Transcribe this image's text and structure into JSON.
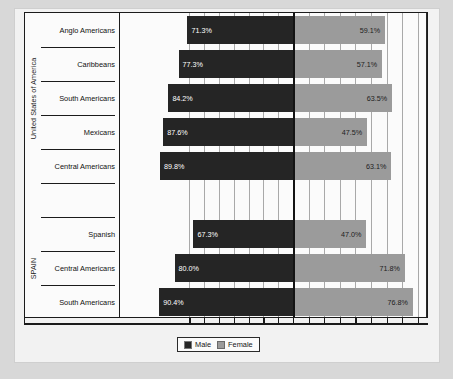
{
  "legend": {
    "items": [
      {
        "label": "Male",
        "color": "#252525",
        "icon": "legend-swatch-male"
      },
      {
        "label": "Female",
        "color": "#9b9b9b",
        "icon": "legend-swatch-female"
      }
    ]
  },
  "groups": [
    {
      "caption": "United States of America"
    },
    {
      "caption": "SPAIN"
    }
  ],
  "chart_data": {
    "type": "bar",
    "subtype": "back-to-back-horizontal-bar",
    "title": "",
    "xlabel": "",
    "ylabel": "",
    "grid": true,
    "legend_position": "bottom-center",
    "value_suffix": "%",
    "axis_tick_labels": [],
    "xlim": [
      0,
      100
    ],
    "groups": [
      {
        "name": "United States of America",
        "categories": [
          "Anglo Americans",
          "Caribbeans",
          "South Americans",
          "Mexicans",
          "Central Americans"
        ],
        "series": [
          {
            "name": "Male",
            "values": [
              71.3,
              77.3,
              84.2,
              87.6,
              89.8
            ],
            "labels": [
              "71.3%",
              "77.3%",
              "84.2%",
              "87.6%",
              "89.8%"
            ]
          },
          {
            "name": "Female",
            "values": [
              59.1,
              57.1,
              63.5,
              47.5,
              63.1
            ],
            "labels": [
              "59.1%",
              "57.1%",
              "63.5%",
              "47.5%",
              "63.1%"
            ]
          }
        ]
      },
      {
        "name": "SPAIN",
        "categories": [
          "Spanish",
          "Central Americans",
          "South Americans"
        ],
        "series": [
          {
            "name": "Male",
            "values": [
              67.3,
              80.0,
              90.4
            ],
            "labels": [
              "67.3%",
              "80.0%",
              "90.4%"
            ]
          },
          {
            "name": "Female",
            "values": [
              47.0,
              71.8,
              76.8
            ],
            "labels": [
              "47.0%",
              "71.8%",
              "76.8%"
            ]
          }
        ]
      }
    ],
    "rows": [
      {
        "group": "United States of America",
        "category": "Anglo Americans",
        "male": 71.3,
        "male_label": "71.3%",
        "female": 59.1,
        "female_label": "59.1%"
      },
      {
        "group": "United States of America",
        "category": "Caribbeans",
        "male": 77.3,
        "male_label": "77.3%",
        "female": 57.1,
        "female_label": "57.1%"
      },
      {
        "group": "United States of America",
        "category": "South Americans",
        "male": 84.2,
        "male_label": "84.2%",
        "female": 63.5,
        "female_label": "63.5%"
      },
      {
        "group": "United States of America",
        "category": "Mexicans",
        "male": 87.6,
        "male_label": "87.6%",
        "female": 47.5,
        "female_label": "47.5%"
      },
      {
        "group": "United States of America",
        "category": "Central Americans",
        "male": 89.8,
        "male_label": "89.8%",
        "female": 63.1,
        "female_label": "63.1%"
      },
      {
        "group": "SPAIN",
        "category": "Spanish",
        "male": 67.3,
        "male_label": "67.3%",
        "female": 47.0,
        "female_label": "47.0%"
      },
      {
        "group": "SPAIN",
        "category": "Central Americans",
        "male": 80.0,
        "male_label": "80.0%",
        "female": 71.8,
        "female_label": "71.8%"
      },
      {
        "group": "SPAIN",
        "category": "South Americans",
        "male": 90.4,
        "male_label": "90.4%",
        "female": 76.8,
        "female_label": "76.8%"
      }
    ]
  }
}
